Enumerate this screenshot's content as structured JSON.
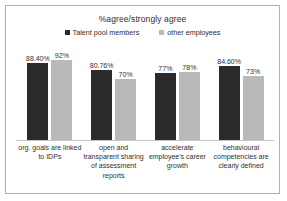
{
  "chart_data": {
    "type": "bar",
    "title": "%agree/strongly agree",
    "xlabel": "",
    "ylabel": "",
    "ylim": [
      0,
      100
    ],
    "grid": false,
    "legend_position": "top-center",
    "categories": [
      "org. goals are linked to IDPs",
      "open and transparent sharing of assessment reports",
      "accelerate employee's career growth",
      "behavioural competencies are clearly defined"
    ],
    "series": [
      {
        "name": "Talent pool members",
        "color": "#2b2b2b",
        "values": [
          88.4,
          80.76,
          77,
          84.6
        ],
        "labels": [
          "88.40%",
          "80.76%",
          "77%",
          "84.60%"
        ]
      },
      {
        "name": "other employees",
        "color": "#b9b9b9",
        "values": [
          92,
          70,
          78,
          73
        ],
        "labels": [
          "92%",
          "70%",
          "78%",
          "73%"
        ]
      }
    ]
  },
  "frame": {
    "border_color": "#b0b0b0",
    "background": "#ffffff",
    "axis_color": "#c8c8c8"
  }
}
